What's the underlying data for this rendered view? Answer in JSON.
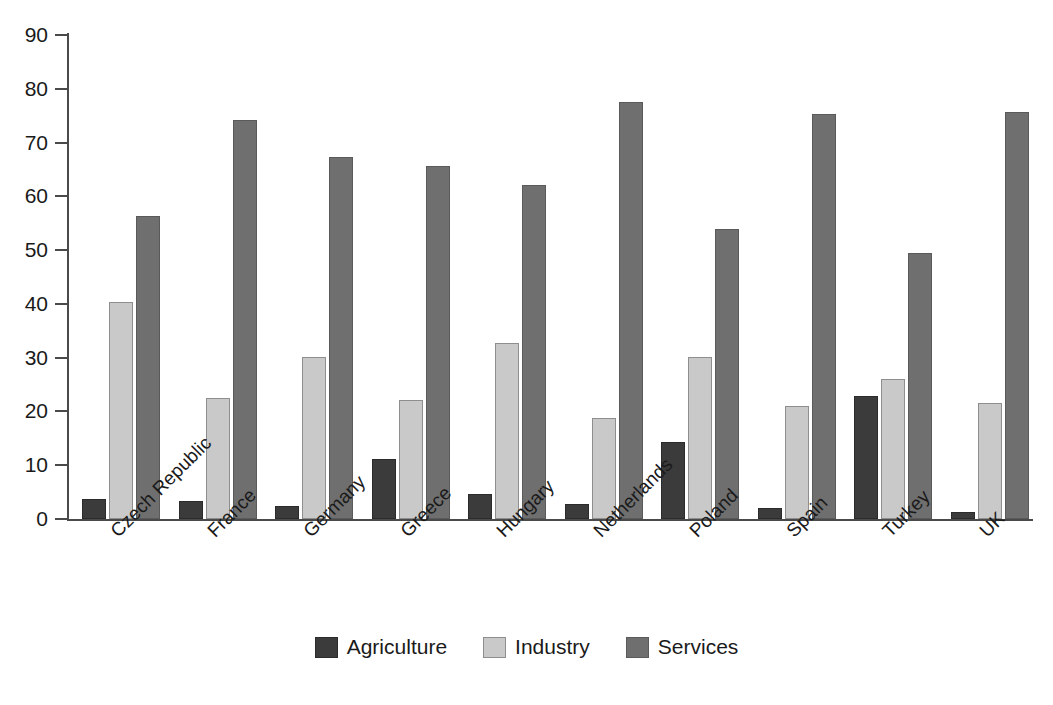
{
  "chart_data": {
    "type": "bar",
    "title": "",
    "subtitle": "",
    "xlabel": "",
    "ylabel": "",
    "ylim": [
      0,
      90
    ],
    "yticks": [
      0,
      10,
      20,
      30,
      40,
      50,
      60,
      70,
      80,
      90
    ],
    "grid": false,
    "legend_position": "bottom",
    "orientation": "vertical",
    "grouping": "grouped",
    "categories": [
      "Czech Republic",
      "France",
      "Germany",
      "Greece",
      "Hungary",
      "Netherlands",
      "Poland",
      "Spain",
      "Turkey",
      "UK"
    ],
    "series": [
      {
        "name": "Agriculture",
        "color": "#3b3b3b",
        "values": [
          3.7,
          3.3,
          2.5,
          11.2,
          4.7,
          2.8,
          14.4,
          2.1,
          22.8,
          1.3
        ]
      },
      {
        "name": "Industry",
        "color": "#c9c9c9",
        "values": [
          40.3,
          22.5,
          30.2,
          22.1,
          32.7,
          18.8,
          30.1,
          21.0,
          26.1,
          21.6
        ]
      },
      {
        "name": "Services",
        "color": "#6f6f6f",
        "values": [
          56.4,
          74.2,
          67.4,
          65.7,
          62.1,
          77.5,
          54.0,
          75.4,
          49.4,
          75.7
        ]
      }
    ]
  },
  "legend": {
    "items": [
      {
        "label": "Agriculture",
        "key": "agriculture"
      },
      {
        "label": "Industry",
        "key": "industry"
      },
      {
        "label": "Services",
        "key": "services"
      }
    ]
  },
  "axes": {
    "y_tick_labels": [
      "90",
      "80",
      "70",
      "60",
      "50",
      "40",
      "30",
      "20",
      "10",
      "0"
    ]
  }
}
